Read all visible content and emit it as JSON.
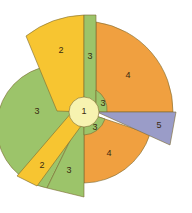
{
  "diagram": {
    "type": "radial-sector-diagram",
    "colors": {
      "level1": "#f7f3b0",
      "level2": "#f7c531",
      "level3": "#9cc46a",
      "level4": "#f0a040",
      "level5": "#9a9cc8",
      "stroke": "#7a6a30"
    },
    "segments": [
      {
        "id": "center",
        "level": 1,
        "label": "1"
      },
      {
        "id": "top-left-yellow",
        "level": 2,
        "label": "2"
      },
      {
        "id": "bottom-left-yellow",
        "level": 2,
        "label": "2"
      },
      {
        "id": "top-green-strip",
        "level": 3,
        "label": "3"
      },
      {
        "id": "left-green",
        "level": 3,
        "label": "3"
      },
      {
        "id": "bottom-green",
        "level": 3,
        "label": "3"
      },
      {
        "id": "inner-green-upper-right",
        "level": 3,
        "label": "3"
      },
      {
        "id": "inner-green-lower-right",
        "level": 3,
        "label": "3"
      },
      {
        "id": "upper-orange",
        "level": 4,
        "label": "4"
      },
      {
        "id": "lower-orange",
        "level": 4,
        "label": "4"
      },
      {
        "id": "purple-wedge",
        "level": 5,
        "label": "5"
      }
    ]
  }
}
